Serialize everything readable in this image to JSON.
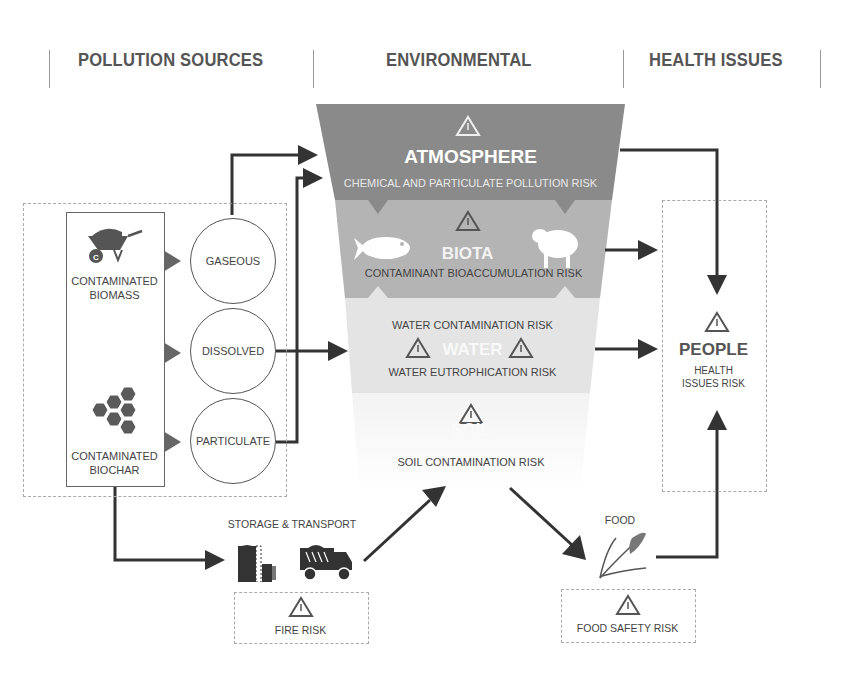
{
  "headers": {
    "pollution_sources": "POLLUTION SOURCES",
    "environmental": "ENVIRONMENTAL",
    "health_issues": "HEALTH ISSUES"
  },
  "sources": {
    "biomass_label_1": "CONTAMINATED",
    "biomass_label_2": "BIOMASS",
    "biochar_label_1": "CONTAMINATED",
    "biochar_label_2": "BIOCHAR",
    "icons": [
      "wheelbarrow-icon",
      "hexagon-cluster-icon"
    ]
  },
  "phases": [
    "GASEOUS",
    "DISSOLVED",
    "PARTICULATE"
  ],
  "environment": {
    "atmosphere": {
      "title": "ATMOSPHERE",
      "risk": "CHEMICAL AND PARTICULATE POLLUTION RISK",
      "color": "#8a8a8a"
    },
    "biota": {
      "title": "BIOTA",
      "risk": "CONTAMINANT BIOACCUMULATION RISK",
      "color": "#b4b4b4",
      "icons": [
        "fish-icon",
        "sheep-icon"
      ]
    },
    "water": {
      "title": "WATER",
      "risk_1": "WATER CONTAMINATION RISK",
      "risk_2": "WATER EUTROPHICATION RISK",
      "color": "#e4e4e4"
    },
    "soil": {
      "title": "SOIL",
      "risk": "SOIL CONTAMINATION RISK",
      "color": "#f7f7f7"
    }
  },
  "people": {
    "title": "PEOPLE",
    "risk_1": "HEALTH",
    "risk_2": "ISSUES RISK"
  },
  "storage": {
    "label": "STORAGE & TRANSPORT",
    "risk": "FIRE RISK",
    "icons": [
      "silo-icon",
      "dump-truck-icon"
    ]
  },
  "food": {
    "label": "FOOD",
    "risk": "FOOD SAFETY RISK",
    "icons": [
      "wheat-icon"
    ]
  },
  "colors": {
    "arrow": "#333333",
    "text": "#4a4a4a",
    "dash": "#aaaaaa"
  }
}
